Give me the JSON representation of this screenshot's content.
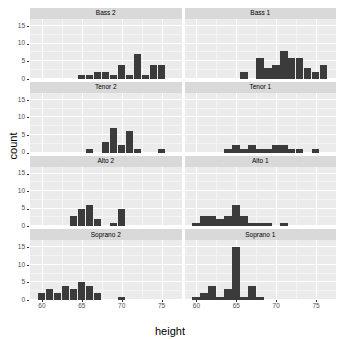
{
  "chart_data": {
    "type": "bar",
    "title": "",
    "subtitle": "",
    "xlabel": "height",
    "ylabel": "count",
    "xlim": [
      58.5,
      77.5
    ],
    "ylim": [
      0,
      17
    ],
    "x_ticks": [
      60,
      65,
      70,
      75
    ],
    "y_ticks": [
      0,
      5,
      10,
      15
    ],
    "grid": true,
    "legend": "none",
    "facet_layout": {
      "rows": 4,
      "cols": 2
    },
    "bin_width": 1,
    "panels": [
      {
        "label": "Bass 2",
        "row": 1,
        "col": 1,
        "x": [
          65,
          66,
          67,
          68,
          69,
          70,
          71,
          72,
          73,
          74,
          75
        ],
        "values": [
          1,
          1,
          2,
          2,
          1,
          4,
          1,
          7,
          1,
          4,
          4
        ]
      },
      {
        "label": "Bass 1",
        "row": 1,
        "col": 2,
        "x": [
          66,
          68,
          69,
          70,
          71,
          72,
          73,
          74,
          75,
          76
        ],
        "values": [
          2,
          6,
          3,
          4,
          8,
          6,
          6,
          3,
          2,
          4
        ]
      },
      {
        "label": "Tenor 2",
        "row": 2,
        "col": 1,
        "x": [
          66,
          68,
          69,
          70,
          71,
          72,
          73,
          75
        ],
        "values": [
          1,
          3,
          7,
          2,
          6,
          1,
          0,
          1
        ]
      },
      {
        "label": "Tenor 1",
        "row": 2,
        "col": 2,
        "x": [
          64,
          65,
          66,
          67,
          68,
          69,
          70,
          71,
          72,
          73,
          75
        ],
        "values": [
          1,
          2,
          1,
          2,
          1,
          1,
          2,
          2,
          1,
          1,
          1
        ]
      },
      {
        "label": "Alto 2",
        "row": 3,
        "col": 1,
        "x": [
          64,
          65,
          66,
          67,
          69,
          70
        ],
        "values": [
          3,
          5,
          6,
          2,
          1,
          5
        ]
      },
      {
        "label": "Alto 1",
        "row": 3,
        "col": 2,
        "x": [
          60,
          61,
          62,
          63,
          64,
          65,
          66,
          67,
          68,
          69,
          71
        ],
        "values": [
          1,
          3,
          3,
          2,
          3,
          6,
          3,
          1,
          1,
          1,
          1
        ]
      },
      {
        "label": "Soprano 2",
        "row": 4,
        "col": 1,
        "x": [
          60,
          61,
          62,
          63,
          64,
          65,
          66,
          67,
          70
        ],
        "values": [
          2,
          3,
          2,
          4,
          3,
          5,
          4,
          2,
          1
        ]
      },
      {
        "label": "Soprano 1",
        "row": 4,
        "col": 2,
        "x": [
          60,
          61,
          62,
          63,
          64,
          65,
          66,
          67,
          68
        ],
        "values": [
          1,
          2,
          4,
          1,
          3,
          15,
          1,
          4,
          1
        ]
      }
    ]
  },
  "axes": {
    "y_title": "count",
    "x_title": "height",
    "y_tick_labels": [
      "0",
      "5",
      "10",
      "15"
    ],
    "x_tick_labels": [
      "60",
      "65",
      "70",
      "75"
    ]
  },
  "theme": {
    "panel_background": "#ebebeb",
    "strip_background": "#d9d9d9",
    "gridline_major": "#ffffff",
    "gridline_minor": "#f5f5f5",
    "bar_fill": "#3b3b3b",
    "plot_background": "#ffffff",
    "tick_text_color": "#4d4d4d"
  }
}
